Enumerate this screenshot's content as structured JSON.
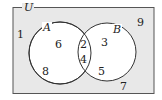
{
  "diagram": {
    "type": "venn",
    "universe_label": "U",
    "sets": [
      {
        "name": "A",
        "label": "A"
      },
      {
        "name": "B",
        "label": "B"
      }
    ],
    "regions": {
      "outside": [
        "1",
        "9",
        "7"
      ],
      "a_only": [
        "6",
        "8"
      ],
      "a_and_b": [
        "2",
        "4"
      ],
      "b_only": [
        "3",
        "5"
      ]
    },
    "colors": {
      "universe_fill": "#e8e8e8",
      "circle_fill": "#ffffff",
      "stroke": "#333333"
    }
  }
}
